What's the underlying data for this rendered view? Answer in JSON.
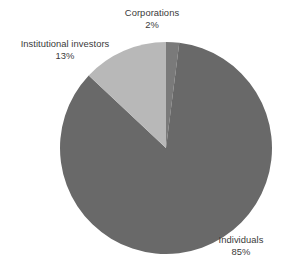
{
  "background_color": "#ffffff",
  "text_color": "#3a3a3a",
  "chart_data": {
    "type": "pie",
    "title": "",
    "subtitle": "",
    "xlabel": "",
    "ylabel": "",
    "grid": false,
    "legend_position": "none",
    "label_style": "outside-callout",
    "start_angle_deg": 0,
    "direction": "clockwise",
    "center": {
      "x": 166,
      "y": 148
    },
    "radius": 106,
    "categories": [
      "Corporations",
      "Individuals",
      "Institutional investors"
    ],
    "values": [
      2,
      85,
      13
    ],
    "value_suffix": "%",
    "colors": [
      "#7a7a7a",
      "#696969",
      "#b8b8b8"
    ],
    "slices": [
      {
        "name": "Corporations",
        "value": 2,
        "value_label": "2%",
        "color": "#7a7a7a",
        "start_angle_deg": 0,
        "end_angle_deg": 7.2
      },
      {
        "name": "Individuals",
        "value": 85,
        "value_label": "85%",
        "color": "#696969",
        "start_angle_deg": 7.2,
        "end_angle_deg": 313.2
      },
      {
        "name": "Institutional investors",
        "value": 13,
        "value_label": "13%",
        "color": "#b8b8b8",
        "start_angle_deg": 313.2,
        "end_angle_deg": 360
      }
    ]
  },
  "labels": {
    "corporations": {
      "name": "Corporations",
      "value": "2%"
    },
    "institutional": {
      "name": "Institutional investors",
      "value": "13%"
    },
    "individuals": {
      "name": "Individuals",
      "value": "85%"
    }
  }
}
